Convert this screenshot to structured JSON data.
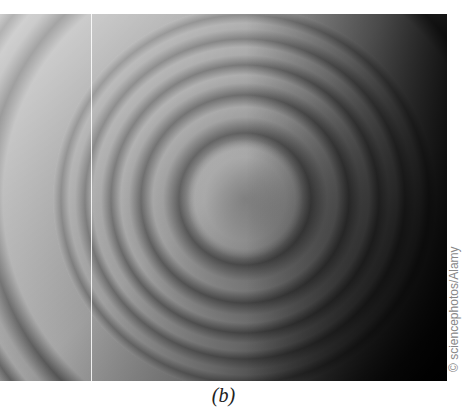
{
  "figure": {
    "caption": "(b)",
    "credit": "© sciencephotos/Alamy"
  }
}
